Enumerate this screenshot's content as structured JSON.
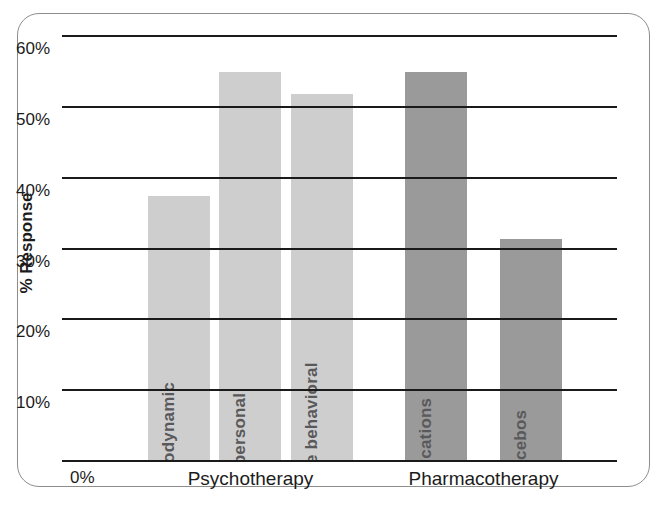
{
  "chart_data": {
    "type": "bar",
    "title": "",
    "xlabel": "",
    "ylabel": "% Response",
    "ylim": [
      0,
      60
    ],
    "ytick_labels": [
      "0%",
      "10%",
      "20%",
      "30%",
      "40%",
      "50%",
      "60%"
    ],
    "ytick_values": [
      0,
      10,
      20,
      30,
      40,
      50,
      60
    ],
    "grid": true,
    "legend": "none",
    "categories": [
      "Psychodynamic",
      "Interpersonal",
      "Cognitive behavioral",
      "Medications",
      "Placebos"
    ],
    "values": [
      37.5,
      55,
      52,
      55,
      31.5
    ],
    "groups": [
      {
        "label": "Psychotherapy",
        "members": [
          "Psychodynamic",
          "Interpersonal",
          "Cognitive behavioral"
        ],
        "color": "#cecece"
      },
      {
        "label": "Pharmacotherapy",
        "members": [
          "Medications",
          "Placebos"
        ],
        "color": "#9a9a9a"
      }
    ],
    "bars": [
      {
        "label": "Psychodynamic",
        "value": 37.5,
        "group": "Psychotherapy",
        "color": "#cecece"
      },
      {
        "label": "Interpersonal",
        "value": 55,
        "group": "Psychotherapy",
        "color": "#cecece"
      },
      {
        "label": "Cognitive behavioral",
        "value": 52,
        "group": "Psychotherapy",
        "color": "#cecece"
      },
      {
        "label": "Medications",
        "value": 55,
        "group": "Pharmacotherapy",
        "color": "#9a9a9a"
      },
      {
        "label": "Placebos",
        "value": 31.5,
        "group": "Pharmacotherapy",
        "color": "#9a9a9a"
      }
    ]
  },
  "colors": {
    "psychotherapy_bar": "#cecece",
    "pharmacotherapy_bar": "#9a9a9a",
    "gridline": "#1a1a1a",
    "bar_label_text": "#59595b",
    "axis_text": "#1c1c1c",
    "frame_border": "#8d8d8d",
    "background": "#ffffff"
  }
}
